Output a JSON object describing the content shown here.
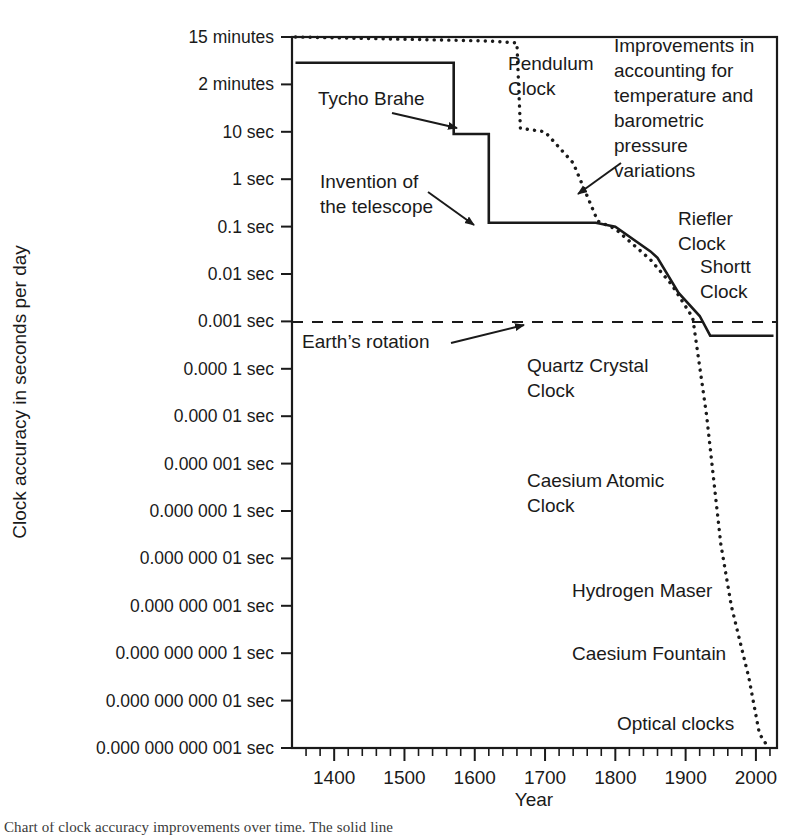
{
  "figure": {
    "title": "",
    "caption_partial": "Chart of clock accuracy improvements over time. The solid line"
  },
  "axes": {
    "x": {
      "label": "Year",
      "ticks": [
        1400,
        1500,
        1600,
        1700,
        1800,
        1900,
        2000
      ],
      "tick_labels": [
        "1400",
        "1500",
        "1600",
        "1700",
        "1800",
        "1900",
        "2000"
      ],
      "range": [
        1340,
        2030
      ],
      "minor_tick_step": 20
    },
    "y": {
      "label": "Clock accuracy in seconds per day",
      "tick_labels": [
        "15 minutes",
        "2 minutes",
        "10 sec",
        "1 sec",
        "0.1 sec",
        "0.01 sec",
        "0.001 sec",
        "0.000 1 sec",
        "0.000 01 sec",
        "0.000 001 sec",
        "0.000 000 1 sec",
        "0.000 000 01 sec",
        "0.000 000 001 sec",
        "0.000 000 000 1 sec",
        "0.000 000 000 01 sec",
        "0.000 000 000 001 sec"
      ],
      "tick_values_seconds": [
        900,
        120,
        10,
        1,
        0.1,
        0.01,
        0.001,
        0.0001,
        1e-05,
        1e-06,
        1e-07,
        1e-08,
        1e-09,
        1e-10,
        1e-11,
        1e-12
      ],
      "scale": "log-descending"
    }
  },
  "annotations": [
    {
      "id": "tycho-brahe",
      "lines": [
        "Tycho Brahe"
      ],
      "x": 318,
      "y": 105,
      "anchor": "start",
      "arrow": {
        "x1": 392,
        "y1": 113,
        "x2": 457,
        "y2": 128
      }
    },
    {
      "id": "invention-telescope",
      "lines": [
        "Invention of",
        "the telescope"
      ],
      "x": 320,
      "y": 188,
      "anchor": "start",
      "arrow": {
        "x1": 428,
        "y1": 192,
        "x2": 474,
        "y2": 225
      }
    },
    {
      "id": "pendulum-clock",
      "lines": [
        "Pendulum",
        "Clock"
      ],
      "x": 508,
      "y": 70,
      "anchor": "start",
      "arrow": null
    },
    {
      "id": "improvements-temp-pressure",
      "lines": [
        "Improvements in",
        "accounting for",
        "temperature and",
        "barometric",
        "pressure",
        "variations"
      ],
      "x": 614,
      "y": 52,
      "anchor": "start",
      "arrow": {
        "x1": 621,
        "y1": 163,
        "x2": 578,
        "y2": 194
      }
    },
    {
      "id": "riefler-clock",
      "lines": [
        "Riefler",
        "Clock"
      ],
      "x": 678,
      "y": 225,
      "anchor": "start",
      "arrow": null
    },
    {
      "id": "shortt-clock",
      "lines": [
        "Shortt",
        "Clock"
      ],
      "x": 700,
      "y": 273,
      "anchor": "start",
      "arrow": null
    },
    {
      "id": "earths-rotation",
      "lines": [
        "Earth’s rotation"
      ],
      "x": 302,
      "y": 348,
      "anchor": "start",
      "arrow": {
        "x1": 451,
        "y1": 343,
        "x2": 524,
        "y2": 325
      }
    },
    {
      "id": "quartz-crystal-clock",
      "lines": [
        "Quartz Crystal",
        "Clock"
      ],
      "x": 527,
      "y": 372,
      "anchor": "start",
      "arrow": null
    },
    {
      "id": "caesium-atomic-clock",
      "lines": [
        "Caesium Atomic",
        "Clock"
      ],
      "x": 527,
      "y": 487,
      "anchor": "start",
      "arrow": null
    },
    {
      "id": "hydrogen-maser",
      "lines": [
        "Hydrogen Maser"
      ],
      "x": 572,
      "y": 597,
      "anchor": "start",
      "arrow": null
    },
    {
      "id": "caesium-fountain",
      "lines": [
        "Caesium Fountain"
      ],
      "x": 572,
      "y": 660,
      "anchor": "start",
      "arrow": null
    },
    {
      "id": "optical-clocks",
      "lines": [
        "Optical clocks"
      ],
      "x": 617,
      "y": 730,
      "anchor": "start",
      "arrow": null
    }
  ],
  "chart_data": {
    "type": "line",
    "title": "",
    "xlabel": "Year",
    "ylabel": "Clock accuracy in seconds per day",
    "xlim": [
      1340,
      2030
    ],
    "ylim_seconds": [
      900,
      1e-12
    ],
    "yscale": "log (inverted: better accuracy downward)",
    "grid": false,
    "legend": "none",
    "series": [
      {
        "name": "Best mechanical clock accuracy (solid line)",
        "style": "solid",
        "points_year_seconds": [
          [
            1345,
            300
          ],
          [
            1570,
            300
          ],
          [
            1570,
            9
          ],
          [
            1620,
            9
          ],
          [
            1620,
            0.12
          ],
          [
            1772,
            0.12
          ],
          [
            1800,
            0.1
          ],
          [
            1850,
            0.03
          ],
          [
            1860,
            0.022
          ],
          [
            1890,
            0.004
          ],
          [
            1920,
            0.0013
          ],
          [
            1935,
            0.0005
          ],
          [
            2025,
            0.0005
          ]
        ]
      },
      {
        "name": "Best overall clock accuracy (dotted line)",
        "style": "dotted",
        "points_year_seconds": [
          [
            1345,
            900
          ],
          [
            1620,
            760
          ],
          [
            1660,
            700
          ],
          [
            1665,
            12
          ],
          [
            1700,
            10
          ],
          [
            1740,
            2.2
          ],
          [
            1775,
            0.13
          ],
          [
            1800,
            0.09
          ],
          [
            1850,
            0.02
          ],
          [
            1880,
            0.006
          ],
          [
            1910,
            0.0012
          ],
          [
            1930,
            1e-05
          ],
          [
            1950,
            2e-08
          ],
          [
            1965,
            1e-09
          ],
          [
            1990,
            3e-11
          ],
          [
            2005,
            2e-12
          ],
          [
            2018,
            1e-12
          ]
        ]
      }
    ],
    "reference_lines": [
      {
        "name": "Earth’s rotation",
        "y_seconds": 0.001,
        "style": "dashed"
      }
    ]
  },
  "icons": {
    "arrowhead": "arrow-head-icon"
  },
  "colors": {
    "ink": "#1a1a1a",
    "background": "#ffffff"
  }
}
